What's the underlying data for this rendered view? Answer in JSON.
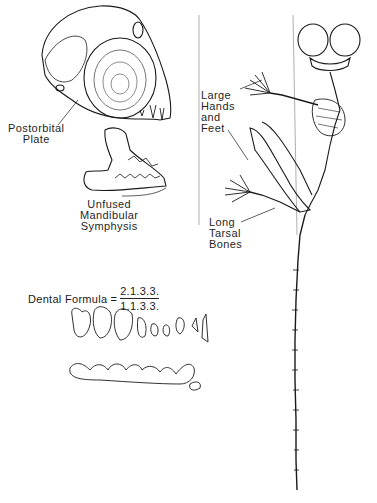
{
  "figure": {
    "type": "anatomical illustration"
  },
  "labels": {
    "postorbital_plate": [
      "Postorbital",
      "Plate"
    ],
    "unfused_mandibular_symphysis": [
      "Unfused",
      "Mandibular",
      "Symphysis"
    ],
    "large_hands_and_feet": [
      "Large",
      "Hands",
      "and",
      "Feet"
    ],
    "long_tarsal_bones": [
      "Long",
      "Tarsal",
      "Bones"
    ]
  },
  "dental_formula": {
    "label": "Dental Formula",
    "equals": "=",
    "upper": "2.1.3.3.",
    "lower": "1.1.3.3."
  },
  "colors": {
    "ink": "#1a1a1a",
    "background": "#ffffff",
    "support_line": "#9a9a9a"
  }
}
